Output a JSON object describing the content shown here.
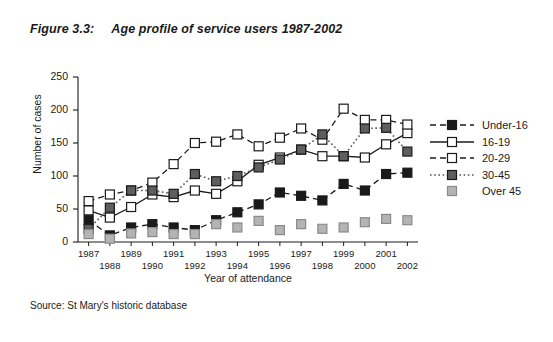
{
  "figure": {
    "number": "Figure 3.3:",
    "title": "Age profile of service users 1987-2002"
  },
  "source": "Source: St Mary's historic database",
  "chart_data": {
    "type": "line",
    "title": "Age profile of service users 1987-2002",
    "xlabel": "Year of attendance",
    "ylabel": "Number of cases",
    "ylim": [
      0,
      250
    ],
    "yticks": [
      0,
      50,
      100,
      150,
      200,
      250
    ],
    "grid": false,
    "legend_position": "right",
    "categories": [
      "1987",
      "1988",
      "1989",
      "1990",
      "1991",
      "1992",
      "1993",
      "1994",
      "1995",
      "1996",
      "1997",
      "1998",
      "1999",
      "2000",
      "2001",
      "2002"
    ],
    "series": [
      {
        "name": "Under-16",
        "marker": "filled-square-black",
        "line": "dashed",
        "color": "#1a1a1a",
        "values": [
          33,
          10,
          22,
          27,
          22,
          18,
          33,
          45,
          57,
          75,
          70,
          63,
          88,
          78,
          103,
          105
        ]
      },
      {
        "name": "16-19",
        "marker": "open-square",
        "line": "solid",
        "color": "#1a1a1a",
        "values": [
          48,
          37,
          53,
          72,
          68,
          78,
          73,
          92,
          117,
          128,
          140,
          130,
          130,
          128,
          148,
          165
        ]
      },
      {
        "name": "20-29",
        "marker": "open-square",
        "line": "dashed",
        "color": "#1a1a1a",
        "values": [
          62,
          72,
          78,
          90,
          118,
          150,
          152,
          163,
          145,
          158,
          172,
          155,
          202,
          185,
          185,
          178
        ]
      },
      {
        "name": "30-45",
        "marker": "filled-square-gray",
        "line": "dotted",
        "color": "#555555",
        "values": [
          20,
          52,
          78,
          78,
          73,
          103,
          92,
          100,
          113,
          125,
          140,
          163,
          130,
          172,
          173,
          137
        ]
      },
      {
        "name": "Over 45",
        "marker": "filled-square-lightgray",
        "line": "none",
        "color": "#9a9a9a",
        "values": [
          12,
          5,
          13,
          15,
          12,
          12,
          27,
          22,
          32,
          18,
          27,
          20,
          22,
          30,
          35,
          33
        ]
      }
    ]
  },
  "legend": {
    "items": [
      {
        "label": "Under-16"
      },
      {
        "label": "16-19"
      },
      {
        "label": "20-29"
      },
      {
        "label": "30-45"
      },
      {
        "label": "Over 45"
      }
    ]
  }
}
